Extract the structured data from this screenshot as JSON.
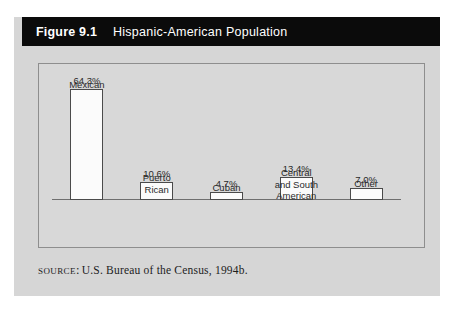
{
  "figure": {
    "number": "Figure 9.1",
    "title": "Hispanic-American Population",
    "header_bg": "#0b0b0b",
    "header_fg": "#ffffff",
    "card_bg": "#d6d6d6",
    "plot_bg": "#d8d8d8",
    "frame_color": "#8e8e8e"
  },
  "source": {
    "label": "Source:",
    "text": "U.S. Bureau of the Census, 1994b."
  },
  "chart_data": {
    "type": "bar",
    "title": "Hispanic-American Population",
    "xlabel": "",
    "ylabel": "",
    "ylim": [
      0,
      70
    ],
    "grid": false,
    "legend": false,
    "unit": "%",
    "categories": [
      "Mexican",
      "Puerto Rican",
      "Cuban",
      "Central and South American",
      "Other"
    ],
    "category_lines": [
      [
        "Mexican"
      ],
      [
        "Puerto",
        "Rican"
      ],
      [
        "Cuban"
      ],
      [
        "Central",
        "and South",
        "American"
      ],
      [
        "Other"
      ]
    ],
    "values": [
      64.3,
      10.6,
      4.7,
      13.4,
      7.0
    ],
    "value_labels": [
      "64.3%",
      "10.6%",
      "4.7%",
      "13.4%",
      "7.0%"
    ],
    "bar_fill": "#fbfbfb",
    "bar_edge": "#4a4a4a",
    "axis_color": "#6f6f6f"
  }
}
